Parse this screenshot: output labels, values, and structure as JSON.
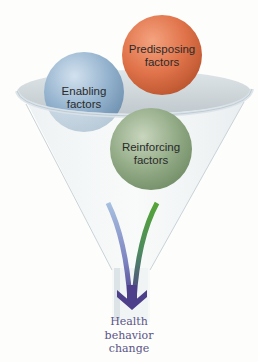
{
  "diagram": {
    "type": "funnel",
    "factors": [
      {
        "id": "predisposing",
        "line1": "Predisposing",
        "line2": "factors",
        "color": "#e0734a"
      },
      {
        "id": "enabling",
        "line1": "Enabling",
        "line2": "factors",
        "color": "#8fb0cc"
      },
      {
        "id": "reinforcing",
        "line1": "Reinforcing",
        "line2": "factors",
        "color": "#8fa883"
      }
    ],
    "streams": [
      {
        "factor": "enabling",
        "color": "#9ab4d8"
      },
      {
        "factor": "predisposing",
        "color": "#e07a3a"
      },
      {
        "factor": "reinforcing",
        "color": "#4e9a32"
      }
    ],
    "arrow_color": "#4e3f8a",
    "outcome": {
      "line1": "Health",
      "line2": "behavior",
      "line3": "change"
    }
  }
}
